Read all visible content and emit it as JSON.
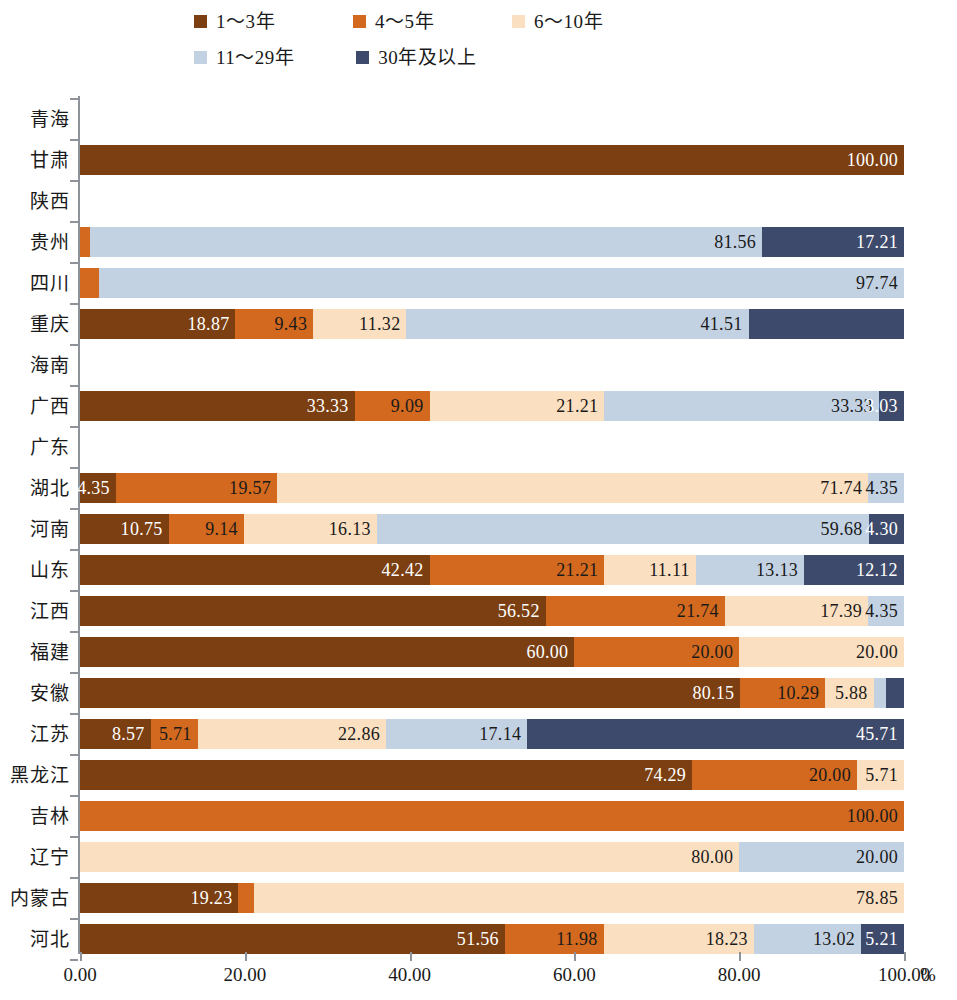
{
  "legend": {
    "items": [
      {
        "label": "1～3年",
        "color": "#7B3F12"
      },
      {
        "label": "4～5年",
        "color": "#D2691E"
      },
      {
        "label": "6～10年",
        "color": "#FBDFC1"
      },
      {
        "label": "11～29年",
        "color": "#C3D2E3"
      },
      {
        "label": "30年及以上",
        "color": "#3E4A6B"
      }
    ]
  },
  "axis": {
    "x_ticks": [
      "0.00",
      "20.00",
      "40.00",
      "60.00",
      "80.00",
      "100.00"
    ],
    "x_unit": "%",
    "x_min": 0,
    "x_max": 100
  },
  "chart_data": {
    "type": "bar",
    "orientation": "horizontal",
    "stacked": true,
    "title": "",
    "xlabel": "%",
    "ylabel": "",
    "xlim": [
      0,
      100
    ],
    "grid": false,
    "legend_position": "top",
    "series": [
      {
        "name": "1～3年",
        "color": "#7B3F12"
      },
      {
        "name": "4～5年",
        "color": "#D2691E"
      },
      {
        "name": "6～10年",
        "color": "#FBDFC1"
      },
      {
        "name": "11～29年",
        "color": "#C3D2E3"
      },
      {
        "name": "30年及以上",
        "color": "#3E4A6B"
      }
    ],
    "categories": [
      "青海",
      "甘肃",
      "陕西",
      "贵州",
      "四川",
      "重庆",
      "海南",
      "广西",
      "广东",
      "湖北",
      "河南",
      "山东",
      "江西",
      "福建",
      "安徽",
      "江苏",
      "黑龙江",
      "吉林",
      "辽宁",
      "内蒙古",
      "河北"
    ],
    "rows": [
      {
        "category": "青海",
        "segments": []
      },
      {
        "category": "甘肃",
        "segments": [
          {
            "series": 0,
            "value": 100.0,
            "label": "100.00"
          }
        ]
      },
      {
        "category": "陕西",
        "segments": []
      },
      {
        "category": "贵州",
        "segments": [
          {
            "series": 1,
            "value": 1.23,
            "label": ""
          },
          {
            "series": 3,
            "value": 81.56,
            "label": "81.56"
          },
          {
            "series": 4,
            "value": 17.21,
            "label": "17.21"
          }
        ]
      },
      {
        "category": "四川",
        "segments": [
          {
            "series": 1,
            "value": 2.26,
            "label": ""
          },
          {
            "series": 3,
            "value": 97.74,
            "label": "97.74"
          }
        ]
      },
      {
        "category": "重庆",
        "segments": [
          {
            "series": 0,
            "value": 18.87,
            "label": "18.87"
          },
          {
            "series": 1,
            "value": 9.43,
            "label": "9.43"
          },
          {
            "series": 2,
            "value": 11.32,
            "label": "11.32"
          },
          {
            "series": 3,
            "value": 41.51,
            "label": "41.51"
          },
          {
            "series": 4,
            "value": 18.87,
            "label": ""
          }
        ]
      },
      {
        "category": "海南",
        "segments": []
      },
      {
        "category": "广西",
        "segments": [
          {
            "series": 0,
            "value": 33.33,
            "label": "33.33"
          },
          {
            "series": 1,
            "value": 9.09,
            "label": "9.09"
          },
          {
            "series": 2,
            "value": 21.21,
            "label": "21.21"
          },
          {
            "series": 3,
            "value": 33.33,
            "label": "33.33"
          },
          {
            "series": 4,
            "value": 3.03,
            "label": "3.03"
          }
        ]
      },
      {
        "category": "广东",
        "segments": []
      },
      {
        "category": "湖北",
        "segments": [
          {
            "series": 0,
            "value": 4.35,
            "label": "4.35"
          },
          {
            "series": 1,
            "value": 19.57,
            "label": "19.57"
          },
          {
            "series": 2,
            "value": 71.74,
            "label": "71.74"
          },
          {
            "series": 3,
            "value": 4.35,
            "label": "4.35"
          }
        ]
      },
      {
        "category": "河南",
        "segments": [
          {
            "series": 0,
            "value": 10.75,
            "label": "10.75"
          },
          {
            "series": 1,
            "value": 9.14,
            "label": "9.14"
          },
          {
            "series": 2,
            "value": 16.13,
            "label": "16.13"
          },
          {
            "series": 3,
            "value": 59.68,
            "label": "59.68"
          },
          {
            "series": 4,
            "value": 4.3,
            "label": "4.30"
          }
        ]
      },
      {
        "category": "山东",
        "segments": [
          {
            "series": 0,
            "value": 42.42,
            "label": "42.42"
          },
          {
            "series": 1,
            "value": 21.21,
            "label": "21.21"
          },
          {
            "series": 2,
            "value": 11.11,
            "label": "11.11"
          },
          {
            "series": 3,
            "value": 13.13,
            "label": "13.13"
          },
          {
            "series": 4,
            "value": 12.12,
            "label": "12.12"
          }
        ]
      },
      {
        "category": "江西",
        "segments": [
          {
            "series": 0,
            "value": 56.52,
            "label": "56.52"
          },
          {
            "series": 1,
            "value": 21.74,
            "label": "21.74"
          },
          {
            "series": 2,
            "value": 17.39,
            "label": "17.39"
          },
          {
            "series": 3,
            "value": 4.35,
            "label": "4.35"
          }
        ]
      },
      {
        "category": "福建",
        "segments": [
          {
            "series": 0,
            "value": 60.0,
            "label": "60.00"
          },
          {
            "series": 1,
            "value": 20.0,
            "label": "20.00"
          },
          {
            "series": 2,
            "value": 20.0,
            "label": "20.00"
          }
        ]
      },
      {
        "category": "安徽",
        "segments": [
          {
            "series": 0,
            "value": 80.15,
            "label": "80.15"
          },
          {
            "series": 1,
            "value": 10.29,
            "label": "10.29"
          },
          {
            "series": 2,
            "value": 5.88,
            "label": "5.88"
          },
          {
            "series": 3,
            "value": 1.47,
            "label": ""
          },
          {
            "series": 4,
            "value": 2.21,
            "label": ""
          }
        ]
      },
      {
        "category": "江苏",
        "segments": [
          {
            "series": 0,
            "value": 8.57,
            "label": "8.57"
          },
          {
            "series": 1,
            "value": 5.71,
            "label": "5.71"
          },
          {
            "series": 2,
            "value": 22.86,
            "label": "22.86"
          },
          {
            "series": 3,
            "value": 17.14,
            "label": "17.14"
          },
          {
            "series": 4,
            "value": 45.71,
            "label": "45.71"
          }
        ]
      },
      {
        "category": "黑龙江",
        "segments": [
          {
            "series": 0,
            "value": 74.29,
            "label": "74.29"
          },
          {
            "series": 1,
            "value": 20.0,
            "label": "20.00"
          },
          {
            "series": 2,
            "value": 5.71,
            "label": "5.71"
          }
        ]
      },
      {
        "category": "吉林",
        "segments": [
          {
            "series": 1,
            "value": 100.0,
            "label": "100.00"
          }
        ]
      },
      {
        "category": "辽宁",
        "segments": [
          {
            "series": 2,
            "value": 80.0,
            "label": "80.00"
          },
          {
            "series": 3,
            "value": 20.0,
            "label": "20.00"
          }
        ]
      },
      {
        "category": "内蒙古",
        "segments": [
          {
            "series": 0,
            "value": 19.23,
            "label": "19.23"
          },
          {
            "series": 1,
            "value": 1.92,
            "label": ""
          },
          {
            "series": 2,
            "value": 78.85,
            "label": "78.85"
          }
        ]
      },
      {
        "category": "河北",
        "segments": [
          {
            "series": 0,
            "value": 51.56,
            "label": "51.56"
          },
          {
            "series": 1,
            "value": 11.98,
            "label": "11.98"
          },
          {
            "series": 2,
            "value": 18.23,
            "label": "18.23"
          },
          {
            "series": 3,
            "value": 13.02,
            "label": "13.02"
          },
          {
            "series": 4,
            "value": 5.21,
            "label": "5.21"
          }
        ]
      }
    ]
  }
}
